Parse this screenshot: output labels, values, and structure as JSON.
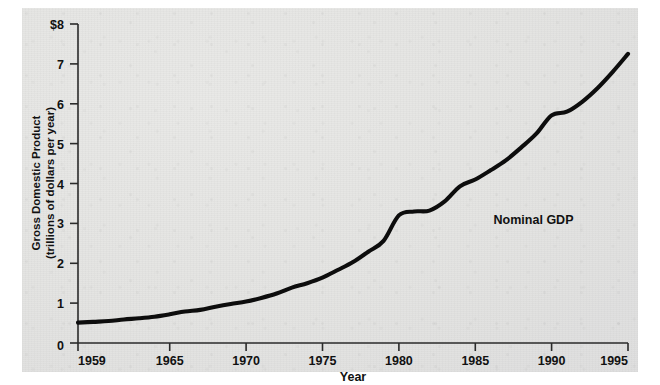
{
  "figure": {
    "background_color": "#e5e5e3",
    "ink_color": "#0d0d0d"
  },
  "chart_data": {
    "type": "line",
    "title": "",
    "xlabel": "Year",
    "ylabel": "Gross Domestic Product (trillions of dollars per year)",
    "ylabel_line1": "Gross Domestic Product",
    "ylabel_line2": "(trillions of dollars per year)",
    "xlim": [
      1959,
      1995
    ],
    "ylim": [
      0,
      8
    ],
    "grid": false,
    "legend_position": "inline-annotation",
    "x_tick_labels": [
      "1959",
      "1965",
      "1970",
      "1975",
      "1980",
      "1985",
      "1990",
      "1995"
    ],
    "x_tick_values": [
      1959,
      1965,
      1970,
      1975,
      1980,
      1985,
      1990,
      1995
    ],
    "y_tick_labels": [
      "0",
      "1",
      "2",
      "3",
      "4",
      "5",
      "6",
      "7",
      "$8"
    ],
    "y_tick_values": [
      0,
      1,
      2,
      3,
      4,
      5,
      6,
      7,
      8
    ],
    "y_unit_prefix": "$",
    "annotations": [
      {
        "text": "Nominal GDP",
        "x": 1986.2,
        "y": 2.98
      }
    ],
    "series": [
      {
        "name": "Nominal GDP",
        "color": "#0d0d0d",
        "x": [
          1959,
          1960,
          1961,
          1962,
          1963,
          1964,
          1965,
          1966,
          1967,
          1968,
          1969,
          1970,
          1971,
          1972,
          1973,
          1974,
          1975,
          1976,
          1977,
          1978,
          1979,
          1980,
          1981,
          1982,
          1983,
          1984,
          1985,
          1986,
          1987,
          1988,
          1989,
          1990,
          1991,
          1992,
          1993,
          1994,
          1995
        ],
        "values": [
          0.51,
          0.53,
          0.55,
          0.59,
          0.62,
          0.66,
          0.72,
          0.79,
          0.83,
          0.91,
          0.98,
          1.04,
          1.13,
          1.24,
          1.39,
          1.5,
          1.64,
          1.83,
          2.03,
          2.29,
          2.56,
          3.2,
          3.3,
          3.32,
          3.55,
          3.93,
          4.1,
          4.33,
          4.58,
          4.9,
          5.25,
          5.71,
          5.8,
          6.05,
          6.39,
          6.8,
          7.25
        ]
      }
    ]
  },
  "axis_titles": {
    "x": "Year",
    "y_line1": "Gross Domestic Product",
    "y_line2": "(trillions of dollars per year)"
  }
}
